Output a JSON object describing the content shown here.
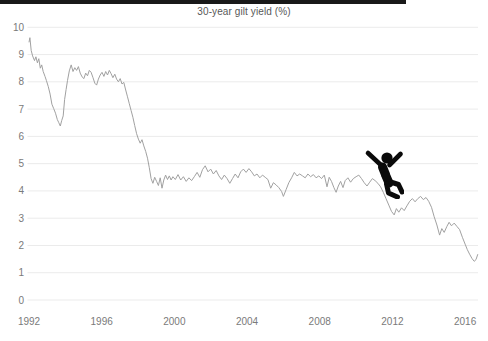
{
  "top_bar": {
    "color": "#191919"
  },
  "chart_data": {
    "type": "line",
    "title": "30-year gilt yield (%)",
    "xlabel": "",
    "ylabel": "",
    "x_ticks": [
      1992,
      1996,
      2000,
      2004,
      2008,
      2012,
      2016
    ],
    "y_ticks": [
      0,
      1,
      2,
      3,
      4,
      5,
      6,
      7,
      8,
      9,
      10
    ],
    "xlim": [
      1992,
      2016.75
    ],
    "ylim": [
      0,
      10
    ],
    "grid": "horizontal-only",
    "legend": "none",
    "line_color": "#a1a1a1",
    "grid_color": "#ebebeb",
    "tick_label_color": "#7a7a7a",
    "annotation": {
      "icon": "falling-person",
      "x": 2011.5,
      "y": 5.0
    },
    "series": [
      {
        "name": "30-year gilt yield",
        "points": [
          [
            1992.0,
            9.45
          ],
          [
            1992.05,
            9.62
          ],
          [
            1992.12,
            9.15
          ],
          [
            1992.2,
            8.95
          ],
          [
            1992.3,
            8.78
          ],
          [
            1992.38,
            8.92
          ],
          [
            1992.46,
            8.7
          ],
          [
            1992.54,
            8.85
          ],
          [
            1992.62,
            8.5
          ],
          [
            1992.7,
            8.62
          ],
          [
            1992.78,
            8.38
          ],
          [
            1992.88,
            8.2
          ],
          [
            1992.96,
            8.05
          ],
          [
            1993.06,
            7.82
          ],
          [
            1993.16,
            7.55
          ],
          [
            1993.26,
            7.18
          ],
          [
            1993.36,
            7.02
          ],
          [
            1993.46,
            6.85
          ],
          [
            1993.56,
            6.62
          ],
          [
            1993.64,
            6.5
          ],
          [
            1993.72,
            6.38
          ],
          [
            1993.8,
            6.58
          ],
          [
            1993.88,
            6.75
          ],
          [
            1993.96,
            7.35
          ],
          [
            1994.04,
            7.72
          ],
          [
            1994.12,
            8.05
          ],
          [
            1994.22,
            8.4
          ],
          [
            1994.32,
            8.62
          ],
          [
            1994.42,
            8.38
          ],
          [
            1994.52,
            8.52
          ],
          [
            1994.62,
            8.42
          ],
          [
            1994.72,
            8.56
          ],
          [
            1994.82,
            8.32
          ],
          [
            1994.92,
            8.18
          ],
          [
            1995.02,
            8.12
          ],
          [
            1995.12,
            8.32
          ],
          [
            1995.22,
            8.22
          ],
          [
            1995.32,
            8.42
          ],
          [
            1995.42,
            8.35
          ],
          [
            1995.52,
            8.15
          ],
          [
            1995.62,
            7.95
          ],
          [
            1995.72,
            7.88
          ],
          [
            1995.82,
            8.1
          ],
          [
            1995.92,
            8.25
          ],
          [
            1996.02,
            8.35
          ],
          [
            1996.12,
            8.2
          ],
          [
            1996.22,
            8.38
          ],
          [
            1996.32,
            8.25
          ],
          [
            1996.42,
            8.42
          ],
          [
            1996.52,
            8.3
          ],
          [
            1996.62,
            8.15
          ],
          [
            1996.72,
            8.28
          ],
          [
            1996.82,
            8.1
          ],
          [
            1996.92,
            8.0
          ],
          [
            1997.02,
            8.12
          ],
          [
            1997.12,
            7.92
          ],
          [
            1997.22,
            7.98
          ],
          [
            1997.32,
            7.7
          ],
          [
            1997.42,
            7.45
          ],
          [
            1997.52,
            7.2
          ],
          [
            1997.62,
            6.95
          ],
          [
            1997.72,
            6.7
          ],
          [
            1997.82,
            6.4
          ],
          [
            1997.92,
            6.1
          ],
          [
            1998.02,
            5.9
          ],
          [
            1998.12,
            5.75
          ],
          [
            1998.22,
            5.88
          ],
          [
            1998.32,
            5.65
          ],
          [
            1998.42,
            5.45
          ],
          [
            1998.52,
            5.2
          ],
          [
            1998.62,
            4.85
          ],
          [
            1998.72,
            4.45
          ],
          [
            1998.82,
            4.28
          ],
          [
            1998.92,
            4.5
          ],
          [
            1999.02,
            4.35
          ],
          [
            1999.12,
            4.2
          ],
          [
            1999.22,
            4.48
          ],
          [
            1999.32,
            4.1
          ],
          [
            1999.42,
            4.4
          ],
          [
            1999.52,
            4.58
          ],
          [
            1999.62,
            4.42
          ],
          [
            1999.72,
            4.55
          ],
          [
            1999.82,
            4.4
          ],
          [
            1999.92,
            4.52
          ],
          [
            2000.05,
            4.42
          ],
          [
            2000.2,
            4.6
          ],
          [
            2000.35,
            4.4
          ],
          [
            2000.5,
            4.52
          ],
          [
            2000.65,
            4.35
          ],
          [
            2000.8,
            4.48
          ],
          [
            2000.95,
            4.38
          ],
          [
            2001.1,
            4.52
          ],
          [
            2001.25,
            4.68
          ],
          [
            2001.4,
            4.5
          ],
          [
            2001.55,
            4.78
          ],
          [
            2001.7,
            4.92
          ],
          [
            2001.85,
            4.7
          ],
          [
            2002.0,
            4.8
          ],
          [
            2002.15,
            4.62
          ],
          [
            2002.3,
            4.75
          ],
          [
            2002.45,
            4.55
          ],
          [
            2002.6,
            4.42
          ],
          [
            2002.75,
            4.58
          ],
          [
            2002.9,
            4.45
          ],
          [
            2003.05,
            4.28
          ],
          [
            2003.2,
            4.45
          ],
          [
            2003.35,
            4.62
          ],
          [
            2003.5,
            4.48
          ],
          [
            2003.65,
            4.7
          ],
          [
            2003.8,
            4.8
          ],
          [
            2003.95,
            4.68
          ],
          [
            2004.1,
            4.82
          ],
          [
            2004.25,
            4.7
          ],
          [
            2004.4,
            4.55
          ],
          [
            2004.55,
            4.62
          ],
          [
            2004.7,
            4.48
          ],
          [
            2004.85,
            4.58
          ],
          [
            2005.0,
            4.5
          ],
          [
            2005.15,
            4.42
          ],
          [
            2005.3,
            4.1
          ],
          [
            2005.45,
            4.3
          ],
          [
            2005.6,
            4.22
          ],
          [
            2005.75,
            4.12
          ],
          [
            2005.9,
            3.98
          ],
          [
            2006.0,
            3.8
          ],
          [
            2006.15,
            4.05
          ],
          [
            2006.3,
            4.3
          ],
          [
            2006.45,
            4.48
          ],
          [
            2006.6,
            4.68
          ],
          [
            2006.75,
            4.55
          ],
          [
            2006.9,
            4.62
          ],
          [
            2007.05,
            4.55
          ],
          [
            2007.2,
            4.48
          ],
          [
            2007.35,
            4.62
          ],
          [
            2007.5,
            4.52
          ],
          [
            2007.65,
            4.6
          ],
          [
            2007.8,
            4.48
          ],
          [
            2007.95,
            4.55
          ],
          [
            2008.1,
            4.45
          ],
          [
            2008.25,
            4.58
          ],
          [
            2008.4,
            4.15
          ],
          [
            2008.52,
            4.5
          ],
          [
            2008.65,
            4.35
          ],
          [
            2008.78,
            4.12
          ],
          [
            2008.9,
            3.95
          ],
          [
            2009.02,
            4.18
          ],
          [
            2009.15,
            4.35
          ],
          [
            2009.28,
            4.12
          ],
          [
            2009.4,
            4.38
          ],
          [
            2009.55,
            4.48
          ],
          [
            2009.7,
            4.32
          ],
          [
            2009.85,
            4.45
          ],
          [
            2010.0,
            4.52
          ],
          [
            2010.15,
            4.58
          ],
          [
            2010.3,
            4.45
          ],
          [
            2010.45,
            4.3
          ],
          [
            2010.6,
            4.18
          ],
          [
            2010.75,
            4.32
          ],
          [
            2010.9,
            4.45
          ],
          [
            2011.05,
            4.38
          ],
          [
            2011.2,
            4.28
          ],
          [
            2011.35,
            4.15
          ],
          [
            2011.5,
            3.95
          ],
          [
            2011.65,
            3.72
          ],
          [
            2011.8,
            3.48
          ],
          [
            2011.95,
            3.25
          ],
          [
            2012.1,
            3.12
          ],
          [
            2012.22,
            3.35
          ],
          [
            2012.35,
            3.22
          ],
          [
            2012.5,
            3.38
          ],
          [
            2012.65,
            3.28
          ],
          [
            2012.8,
            3.45
          ],
          [
            2012.95,
            3.62
          ],
          [
            2013.1,
            3.72
          ],
          [
            2013.25,
            3.6
          ],
          [
            2013.4,
            3.72
          ],
          [
            2013.55,
            3.8
          ],
          [
            2013.7,
            3.68
          ],
          [
            2013.85,
            3.76
          ],
          [
            2014.0,
            3.62
          ],
          [
            2014.15,
            3.4
          ],
          [
            2014.3,
            3.05
          ],
          [
            2014.45,
            2.75
          ],
          [
            2014.6,
            2.38
          ],
          [
            2014.72,
            2.62
          ],
          [
            2014.85,
            2.48
          ],
          [
            2015.0,
            2.7
          ],
          [
            2015.12,
            2.85
          ],
          [
            2015.25,
            2.72
          ],
          [
            2015.4,
            2.82
          ],
          [
            2015.55,
            2.7
          ],
          [
            2015.7,
            2.58
          ],
          [
            2015.85,
            2.3
          ],
          [
            2016.0,
            2.05
          ],
          [
            2016.12,
            1.85
          ],
          [
            2016.25,
            1.68
          ],
          [
            2016.38,
            1.52
          ],
          [
            2016.5,
            1.42
          ],
          [
            2016.6,
            1.48
          ],
          [
            2016.7,
            1.68
          ]
        ]
      }
    ]
  }
}
